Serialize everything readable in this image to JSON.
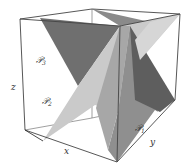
{
  "figure": {
    "axes": {
      "x_label": "x",
      "y_label": "y",
      "z_label": "z"
    },
    "planes": [
      {
        "id": "P1",
        "label": "𝒫",
        "subscript": "1",
        "color": "#6e6e6e"
      },
      {
        "id": "P2",
        "label": "𝒫",
        "subscript": "2",
        "color": "#c8c8c8"
      },
      {
        "id": "P3",
        "label": "𝒫",
        "subscript": "3",
        "color": "#7a7a7a"
      }
    ],
    "colors": {
      "dark_plane": "#6e6e6e",
      "mid_plane": "#9a9a9a",
      "light_plane": "#cfcfcf",
      "edge": "#444444",
      "background": "#ffffff"
    }
  }
}
